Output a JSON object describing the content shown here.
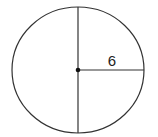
{
  "diagram": {
    "type": "circle-with-radius",
    "radius_label": "6",
    "stroke_color": "#333333",
    "background": "#ffffff"
  }
}
